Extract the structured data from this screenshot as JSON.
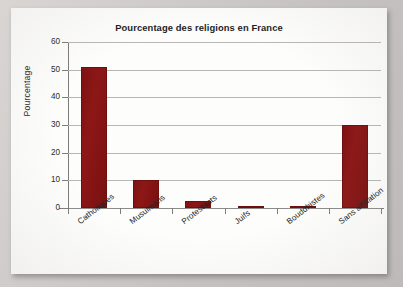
{
  "chart_data": {
    "type": "bar",
    "title": "Pourcentage des religions en France",
    "xlabel": "",
    "ylabel": "Pourcentage",
    "categories": [
      "Catholiques",
      "Musulmans",
      "Protestants",
      "Juifs",
      "Bouddhistes",
      "Sans affiliation"
    ],
    "values": [
      51,
      10,
      2.5,
      0.7,
      0.6,
      30
    ],
    "ylim": [
      0,
      60
    ],
    "yticks": [
      0,
      10,
      20,
      30,
      40,
      50,
      60
    ],
    "ytick_labels": [
      "0",
      "10",
      "20",
      "30",
      "40",
      "50",
      "60"
    ],
    "grid": true,
    "legend": false,
    "bar_color": "#8b1515",
    "gridline_color": "#b9b7b5",
    "axis_color": "#7e7c7a",
    "background_color": "#fdfdfc"
  },
  "page": {
    "surround_color": "#c9c6c4"
  }
}
